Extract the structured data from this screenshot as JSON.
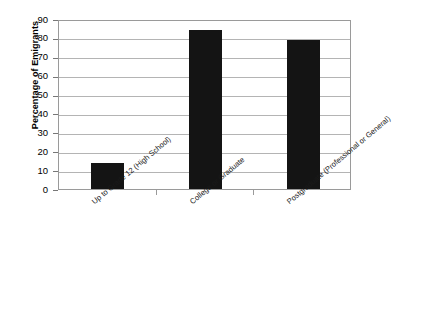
{
  "chart_data": {
    "type": "bar",
    "title": "",
    "xlabel": "",
    "ylabel": "Percentage of Emigrants",
    "ylim": [
      0,
      90
    ],
    "ytick_step": 10,
    "yticks": [
      "0",
      "10",
      "20",
      "30",
      "40",
      "50",
      "60",
      "70",
      "80",
      "90"
    ],
    "grid": true,
    "legend": "none",
    "bar_color": "#141414",
    "plot_border_color": "#9a9a9a",
    "gridline_color": "#b4b4b4",
    "categories": [
      "Up to Grade 12 (High School)",
      "College or Graduate",
      "Postgraduate (Professional or General)"
    ],
    "values": [
      14,
      84,
      79
    ]
  }
}
